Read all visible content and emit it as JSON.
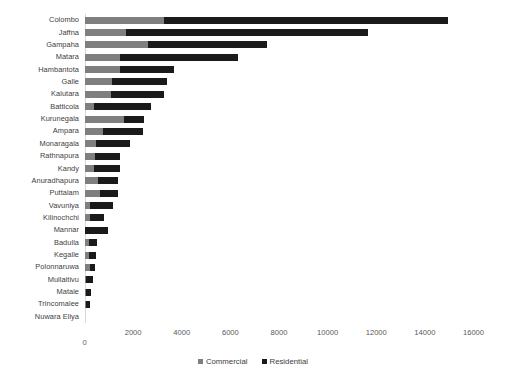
{
  "chart_data": {
    "type": "bar",
    "orientation": "horizontal",
    "stacked": true,
    "title": "",
    "subtitle": "",
    "xlabel": "",
    "ylabel": "",
    "xlim": [
      0,
      16000
    ],
    "xticks": [
      "0",
      "2000",
      "4000",
      "6000",
      "8000",
      "10000",
      "12000",
      "14000",
      "16000"
    ],
    "xtick_values": [
      0,
      2000,
      4000,
      6000,
      8000,
      10000,
      12000,
      14000,
      16000
    ],
    "grid": false,
    "legend_position": "bottom",
    "categories": [
      "Colombo",
      "Jaffna",
      "Gampaha",
      "Matara",
      "Hambantota",
      "Galle",
      "Kalutara",
      "Batticola",
      "Kurunegala",
      "Ampara",
      "Monaragala",
      "Rathnapura",
      "Kandy",
      "Anuradhapura",
      "Puttalam",
      "Vavuniya",
      "Kilinochchi",
      "Mannar",
      "Badulla",
      "Kegalle",
      "Polonnaruwa",
      "Mullaitivu",
      "Matale",
      "Trincomalee",
      "Nuwara Eliya"
    ],
    "series": [
      {
        "name": "Commercial",
        "color": "#7f7f7f",
        "values": [
          3280,
          1720,
          2630,
          1480,
          1450,
          1150,
          1080,
          400,
          1620,
          760,
          480,
          420,
          400,
          540,
          640,
          230,
          210,
          30,
          180,
          200,
          220,
          60,
          60,
          70,
          0
        ]
      },
      {
        "name": "Residential",
        "color": "#1a1a1a",
        "values": [
          11670,
          9930,
          4870,
          4830,
          2240,
          2250,
          2180,
          2320,
          840,
          1640,
          1380,
          1050,
          1040,
          840,
          740,
          940,
          600,
          940,
          330,
          260,
          230,
          300,
          220,
          150,
          0
        ]
      }
    ],
    "totals": [
      14950,
      11650,
      7500,
      6310,
      3690,
      3400,
      3260,
      2720,
      2460,
      2400,
      1860,
      1470,
      1440,
      1380,
      1380,
      1170,
      810,
      970,
      510,
      460,
      450,
      360,
      280,
      220,
      0
    ]
  },
  "legend": {
    "items": [
      {
        "label": "Commercial",
        "color": "#7f7f7f"
      },
      {
        "label": "Residential",
        "color": "#1a1a1a"
      }
    ]
  }
}
